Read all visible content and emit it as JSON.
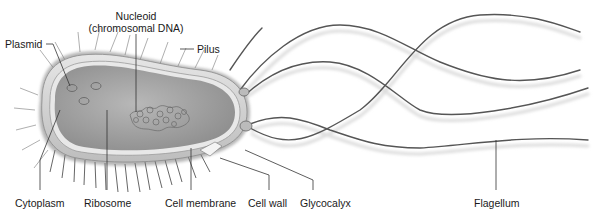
{
  "diagram": {
    "colors": {
      "background": "#ffffff",
      "cytoplasm": "#a9a9a9",
      "cell_wall": "#d4d4d4",
      "glycocalyx": "#6e6e6e",
      "flagellum": "#5a5a5a",
      "leader_line": "#333333",
      "label_text": "#1a1a1a"
    },
    "labels": {
      "plasmid": "Plasmid",
      "nucleoid_line1": "Nucleoid",
      "nucleoid_line2": "(chromosomal DNA)",
      "pilus": "Pilus",
      "cytoplasm": "Cytoplasm",
      "ribosome": "Ribosome",
      "cell_membrane": "Cell membrane",
      "cell_wall": "Cell wall",
      "glycocalyx": "Glycocalyx",
      "flagellum": "Flagellum"
    }
  }
}
